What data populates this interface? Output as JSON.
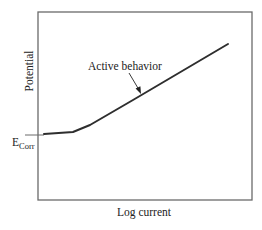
{
  "diagram": {
    "type": "polarization-curve",
    "y_axis_label": "Potential",
    "x_axis_label": "Log current",
    "ecorr_label": {
      "main": "E",
      "subscript": "Corr"
    },
    "annotation": "Active behavior",
    "colors": {
      "frame": "#6a6a6a",
      "curve": "#2e2e2e",
      "text": "#222222",
      "background": "#ffffff"
    },
    "curve_points": [
      [
        44,
        134
      ],
      [
        73,
        132
      ],
      [
        90,
        125
      ],
      [
        133,
        100
      ],
      [
        228,
        44
      ]
    ],
    "frame": {
      "left": 38,
      "top": 12,
      "right": 252,
      "bottom": 200
    }
  }
}
